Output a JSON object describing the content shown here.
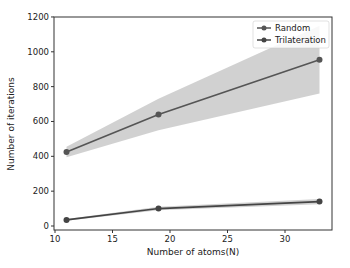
{
  "chart_data": {
    "type": "line",
    "title": "",
    "xlabel": "Number of atoms(N)",
    "ylabel": "Number of iterations",
    "xlim": [
      10,
      34
    ],
    "ylim": [
      -20,
      1200
    ],
    "xticks": [
      10,
      15,
      20,
      25,
      30
    ],
    "yticks": [
      0,
      200,
      400,
      600,
      800,
      1000,
      1200
    ],
    "grid": false,
    "legend_position": "upper right",
    "x": [
      11,
      19,
      33
    ],
    "series": [
      {
        "name": "Random",
        "values": [
          425,
          640,
          955
        ],
        "band_low": [
          395,
          550,
          760
        ],
        "band_high": [
          455,
          730,
          1150
        ],
        "color": "#555555"
      },
      {
        "name": "Trilateration",
        "values": [
          35,
          100,
          140
        ],
        "band_low": [
          30,
          90,
          125
        ],
        "band_high": [
          40,
          110,
          155
        ],
        "color": "#444444"
      }
    ]
  }
}
